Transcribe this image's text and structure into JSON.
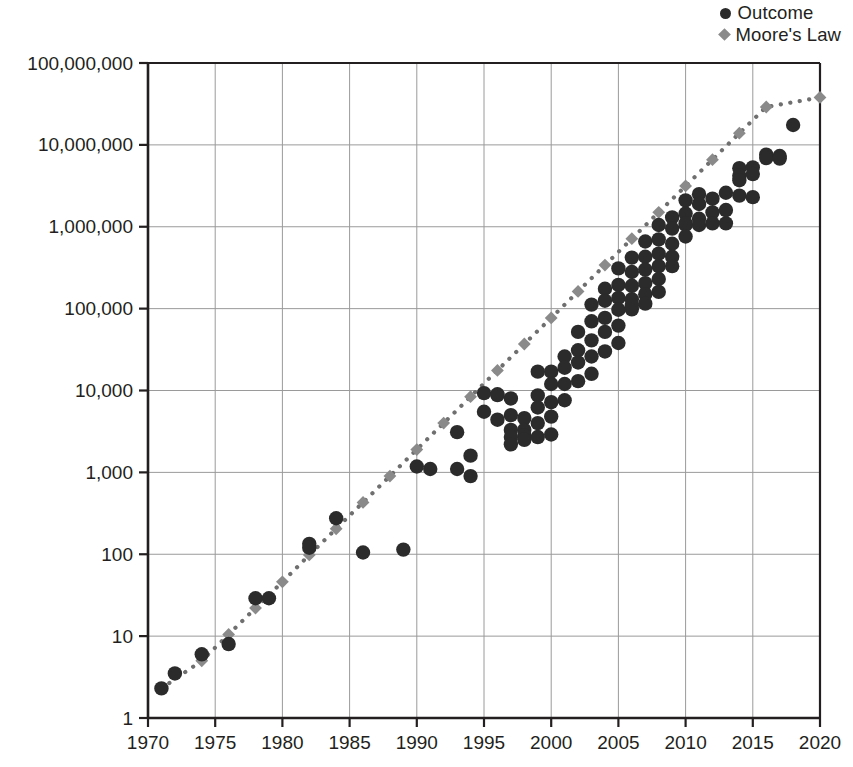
{
  "legend": {
    "position": "top-right",
    "items": [
      {
        "label": "Outcome",
        "marker": "circle",
        "color": "#2b2b2b",
        "icon": "filled-circle-icon"
      },
      {
        "label": "Moore's Law",
        "marker": "diamond",
        "color": "#8a8a8a",
        "icon": "filled-diamond-icon"
      }
    ]
  },
  "chart_data": {
    "type": "scatter",
    "title": "",
    "subtitle": "",
    "xlabel": "",
    "ylabel": "",
    "yscale": "log",
    "xscale": "linear",
    "xlim": [
      1970,
      2020
    ],
    "ylim": [
      1,
      100000000
    ],
    "grid": true,
    "x_ticks": [
      1970,
      1975,
      1980,
      1985,
      1990,
      1995,
      2000,
      2005,
      2010,
      2015,
      2020
    ],
    "x_tick_labels": [
      "1970",
      "1975",
      "1980",
      "1985",
      "1990",
      "1995",
      "2000",
      "2005",
      "2010",
      "2015",
      "2020"
    ],
    "y_ticks": [
      1,
      10,
      100,
      1000,
      10000,
      100000,
      1000000,
      10000000,
      100000000
    ],
    "y_tick_labels": [
      "1",
      "10",
      "100",
      "1,000",
      "10,000",
      "100,000",
      "1,000,000",
      "10,000,000",
      "100,000,000"
    ],
    "series": [
      {
        "name": "Moore's Law",
        "marker": "diamond",
        "color": "#8a8a8a",
        "line": "dotted",
        "line_color": "#6f6f6f",
        "points": [
          [
            1971,
            2.3
          ],
          [
            1974,
            5.0
          ],
          [
            1976,
            10.5
          ],
          [
            1978,
            22
          ],
          [
            1980,
            46
          ],
          [
            1982,
            98
          ],
          [
            1984,
            205
          ],
          [
            1986,
            430
          ],
          [
            1988,
            900
          ],
          [
            1990,
            1900
          ],
          [
            1992,
            4000
          ],
          [
            1994,
            8400
          ],
          [
            1996,
            17600
          ],
          [
            1998,
            37000
          ],
          [
            2000,
            77000
          ],
          [
            2002,
            162000
          ],
          [
            2004,
            340000
          ],
          [
            2006,
            715000
          ],
          [
            2008,
            1500000
          ],
          [
            2010,
            3150000
          ],
          [
            2012,
            6600000
          ],
          [
            2014,
            13900000
          ],
          [
            2016,
            29000000
          ],
          [
            2020,
            38000000
          ]
        ]
      },
      {
        "name": "Outcome",
        "marker": "circle",
        "color": "#2b2b2b",
        "line": "none",
        "points": [
          [
            1971,
            2.3
          ],
          [
            1972,
            3.5
          ],
          [
            1974,
            6.0
          ],
          [
            1976,
            8.0
          ],
          [
            1978,
            29
          ],
          [
            1979,
            29
          ],
          [
            1982,
            134
          ],
          [
            1982,
            120
          ],
          [
            1984,
            275
          ],
          [
            1986,
            105
          ],
          [
            1989,
            114
          ],
          [
            1990,
            1180
          ],
          [
            1991,
            1100
          ],
          [
            1993,
            1100
          ],
          [
            1993,
            3100
          ],
          [
            1994,
            1600
          ],
          [
            1994,
            900
          ],
          [
            1995,
            5500
          ],
          [
            1995,
            9300
          ],
          [
            1996,
            8800
          ],
          [
            1996,
            4400
          ],
          [
            1996,
            9000
          ],
          [
            1997,
            8000
          ],
          [
            1997,
            5000
          ],
          [
            1997,
            3300
          ],
          [
            1997,
            2700
          ],
          [
            1997,
            2200
          ],
          [
            1998,
            4600
          ],
          [
            1998,
            3300
          ],
          [
            1998,
            2800
          ],
          [
            1998,
            2500
          ],
          [
            1999,
            17000
          ],
          [
            1999,
            8700
          ],
          [
            1999,
            6200
          ],
          [
            1999,
            4000
          ],
          [
            1999,
            2700
          ],
          [
            2000,
            17000
          ],
          [
            2000,
            12000
          ],
          [
            2000,
            7200
          ],
          [
            2000,
            4800
          ],
          [
            2000,
            2900
          ],
          [
            2001,
            26000
          ],
          [
            2001,
            19000
          ],
          [
            2001,
            12000
          ],
          [
            2001,
            7600
          ],
          [
            2002,
            52000
          ],
          [
            2002,
            31000
          ],
          [
            2002,
            22000
          ],
          [
            2002,
            13000
          ],
          [
            2003,
            112000
          ],
          [
            2003,
            70000
          ],
          [
            2003,
            41000
          ],
          [
            2003,
            26000
          ],
          [
            2003,
            16000
          ],
          [
            2004,
            175000
          ],
          [
            2004,
            125000
          ],
          [
            2004,
            77000
          ],
          [
            2004,
            52000
          ],
          [
            2004,
            30000
          ],
          [
            2005,
            310000
          ],
          [
            2005,
            195000
          ],
          [
            2005,
            135000
          ],
          [
            2005,
            97000
          ],
          [
            2005,
            62000
          ],
          [
            2005,
            38000
          ],
          [
            2006,
            420000
          ],
          [
            2006,
            280000
          ],
          [
            2006,
            190000
          ],
          [
            2006,
            130000
          ],
          [
            2006,
            98000
          ],
          [
            2006,
            110000
          ],
          [
            2007,
            660000
          ],
          [
            2007,
            430000
          ],
          [
            2007,
            300000
          ],
          [
            2007,
            205000
          ],
          [
            2007,
            150000
          ],
          [
            2007,
            115000
          ],
          [
            2008,
            1050000
          ],
          [
            2008,
            700000
          ],
          [
            2008,
            470000
          ],
          [
            2008,
            330000
          ],
          [
            2008,
            230000
          ],
          [
            2008,
            160000
          ],
          [
            2009,
            1300000
          ],
          [
            2009,
            950000
          ],
          [
            2009,
            620000
          ],
          [
            2009,
            430000
          ],
          [
            2009,
            330000
          ],
          [
            2010,
            2100000
          ],
          [
            2010,
            1450000
          ],
          [
            2010,
            1050000
          ],
          [
            2010,
            1100000
          ],
          [
            2010,
            760000
          ],
          [
            2011,
            2500000
          ],
          [
            2011,
            1900000
          ],
          [
            2011,
            1250000
          ],
          [
            2011,
            1050000
          ],
          [
            2012,
            2200000
          ],
          [
            2012,
            1500000
          ],
          [
            2012,
            1100000
          ],
          [
            2013,
            2600000
          ],
          [
            2013,
            1600000
          ],
          [
            2013,
            1100000
          ],
          [
            2014,
            5200000
          ],
          [
            2014,
            4200000
          ],
          [
            2014,
            3700000
          ],
          [
            2014,
            2400000
          ],
          [
            2015,
            5300000
          ],
          [
            2015,
            4400000
          ],
          [
            2015,
            2300000
          ],
          [
            2016,
            7600000
          ],
          [
            2016,
            6900000
          ],
          [
            2017,
            7300000
          ],
          [
            2017,
            6800000
          ],
          [
            2018,
            17500000
          ]
        ]
      }
    ]
  },
  "plot_geometry": {
    "left": 148,
    "right": 820,
    "top": 63,
    "bottom": 718
  }
}
